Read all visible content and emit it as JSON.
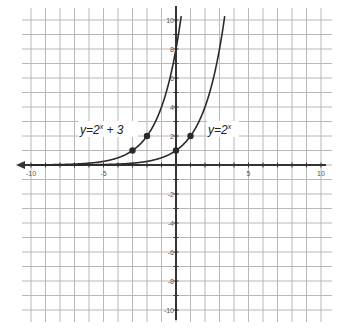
{
  "chart_data": {
    "type": "line",
    "title": "",
    "xlabel": "",
    "ylabel": "",
    "xlim": [
      -10,
      10
    ],
    "ylim": [
      -10,
      10
    ],
    "grid": true,
    "x_tick_labels": [
      "-10",
      "-5",
      "5",
      "10"
    ],
    "y_tick_labels": [
      "10",
      "8",
      "6",
      "4",
      "2",
      "-2",
      "-4",
      "-6",
      "-8",
      "-10"
    ],
    "series": [
      {
        "name": "y=2^x + 3",
        "label_base": "y=2",
        "label_exp": "x",
        "label_tail": " + 3",
        "function": "2^(x+3)",
        "points": [
          [
            -3,
            1
          ],
          [
            -2,
            2
          ]
        ],
        "sample": [
          [
            -10,
            0.008
          ],
          [
            -5,
            0.25
          ],
          [
            -4,
            0.5
          ],
          [
            -3,
            1
          ],
          [
            -2,
            2
          ],
          [
            -1,
            4
          ],
          [
            0,
            8
          ],
          [
            0.3,
            9.85
          ]
        ]
      },
      {
        "name": "y=2^x",
        "label_base": "y=2",
        "label_exp": "x",
        "label_tail": "",
        "function": "2^x",
        "points": [
          [
            0,
            1
          ],
          [
            1,
            2
          ]
        ],
        "sample": [
          [
            -10,
            0.001
          ],
          [
            -5,
            0.031
          ],
          [
            -2,
            0.25
          ],
          [
            -1,
            0.5
          ],
          [
            0,
            1
          ],
          [
            1,
            2
          ],
          [
            2,
            4
          ],
          [
            3,
            8
          ],
          [
            3.3,
            9.85
          ]
        ]
      }
    ]
  },
  "colors": {
    "grid": "#b8b8b8",
    "axis": "#333333",
    "curve": "#2a2a2a"
  }
}
